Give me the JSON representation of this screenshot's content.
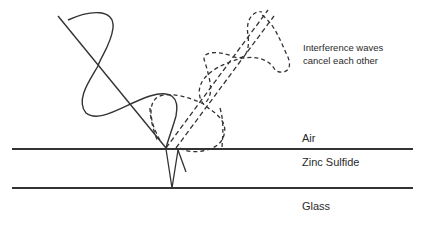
{
  "diagram": {
    "annotation": {
      "line1": "Interference waves",
      "line2": "cancel each other"
    },
    "layers": [
      {
        "name": "Air"
      },
      {
        "name": "Zinc Sulfide"
      },
      {
        "name": "Glass"
      }
    ],
    "colors": {
      "stroke": "#2e2e2e",
      "background": "#ffffff"
    }
  }
}
